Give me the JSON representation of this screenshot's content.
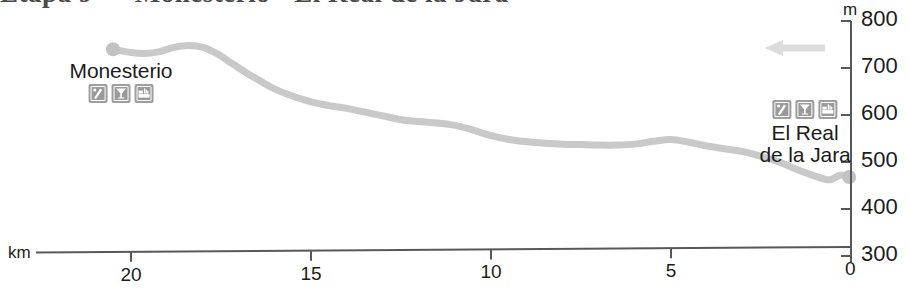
{
  "header": {
    "title_fragment": "Etapa 9 — Monesterio · El Real de la Jara"
  },
  "chart_data": {
    "type": "area",
    "title": "",
    "subtitle": "",
    "xlabel": "km",
    "ylabel": "m",
    "xlim": [
      23.5,
      -0.5
    ],
    "ylim": [
      300,
      800
    ],
    "x_ticks": [
      20,
      15,
      10,
      5,
      0
    ],
    "x_tick_labels": [
      "20",
      "15",
      "10",
      "5",
      "0"
    ],
    "y_ticks": [
      800,
      700,
      600,
      500,
      400,
      300
    ],
    "y_tick_labels": [
      "800",
      "700",
      "600",
      "500",
      "400",
      "300"
    ],
    "grid": false,
    "legend": "none",
    "direction_note": "travel direction right-to-left (descending km)",
    "series": [
      {
        "name": "Elevation profile",
        "color": "#c9c9c9",
        "units": "m",
        "x": [
          20.5,
          20.0,
          19.6,
          19.2,
          18.8,
          18.4,
          18.0,
          17.6,
          17.2,
          16.8,
          16.4,
          16.0,
          15.5,
          15.0,
          14.5,
          14.0,
          13.5,
          13.0,
          12.5,
          12.0,
          11.5,
          11.0,
          10.5,
          10.0,
          9.5,
          9.0,
          8.5,
          8.0,
          7.5,
          7.0,
          6.5,
          6.0,
          5.5,
          5.0,
          4.5,
          4.0,
          3.5,
          3.0,
          2.5,
          2.0,
          1.5,
          1.0,
          0.6,
          0.3,
          0.05
        ],
        "y": [
          740,
          733,
          731,
          735,
          744,
          748,
          744,
          730,
          710,
          690,
          672,
          655,
          640,
          628,
          620,
          614,
          606,
          598,
          590,
          586,
          583,
          578,
          568,
          556,
          548,
          543,
          540,
          538,
          537,
          536,
          536,
          538,
          544,
          548,
          542,
          534,
          528,
          522,
          512,
          500,
          484,
          470,
          462,
          472,
          468
        ]
      }
    ],
    "markers": [
      {
        "name": "start-marker",
        "x": 20.5,
        "y": 740,
        "color": "#c2c2c2",
        "radius": 7
      },
      {
        "name": "end-marker",
        "x": 0.05,
        "y": 468,
        "color": "#c2c2c2",
        "radius": 7
      }
    ],
    "annotations": [
      {
        "name": "Monesterio",
        "lines": [
          "Monesterio"
        ],
        "icons": [
          "hiking-icon",
          "cocktail-glass-icon",
          "lodging-bed-icon"
        ],
        "label_x_px": 121,
        "label_y_px": 60
      },
      {
        "name": "El Real de la Jara",
        "lines": [
          "El Real",
          "de la Jara"
        ],
        "icons": [
          "hiking-icon",
          "cocktail-glass-icon",
          "lodging-bed-icon"
        ],
        "label_x_px": 805,
        "label_y_px": 100
      }
    ],
    "direction_arrow": {
      "name": "direction-arrow",
      "points_to": "left",
      "color": "#dcdcdc",
      "x_px": 765,
      "y_px": 48
    }
  },
  "axes": {
    "unit_x": "km",
    "unit_y": "m",
    "origin_label": "0"
  },
  "colors": {
    "profile_line": "#c9c9c9",
    "axis": "#58585a",
    "text": "#1c1c1c",
    "icon_background": "#9e9e9e",
    "arrow": "#dcdcdc"
  }
}
